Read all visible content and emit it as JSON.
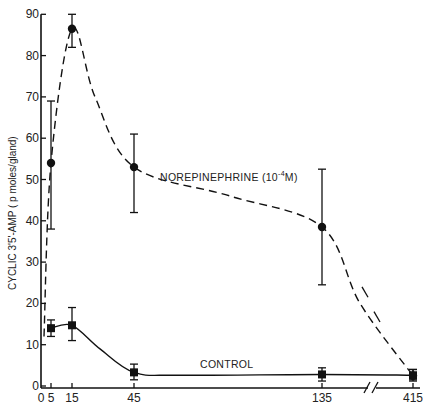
{
  "chart_data": {
    "type": "line",
    "title": "",
    "xlabel": "",
    "ylabel": "CYCLIC 3'5'-AMP ( p moles/gland)",
    "ylim": [
      0,
      90
    ],
    "y_ticks": [
      0,
      10,
      20,
      30,
      40,
      50,
      60,
      70,
      80,
      90
    ],
    "x_ticks": [
      0,
      5,
      15,
      45,
      135,
      415
    ],
    "x_tick_labels": [
      "0",
      "5",
      "15",
      "45",
      "135",
      "415"
    ],
    "x_axis_break": "between 135 and 415",
    "grid": false,
    "x": [
      5,
      15,
      45,
      135,
      415
    ],
    "series": [
      {
        "name": "NOREPINEPHRINE (10^-4 M)",
        "label_text": "NOREPINEPHRINE (10",
        "label_sup": "-4",
        "label_tail": "M)",
        "marker": "circle",
        "line_style": "dashed",
        "values": [
          54,
          86.5,
          53,
          38.5,
          2.5
        ],
        "err_low": [
          38,
          82,
          42,
          24.5,
          1.5
        ],
        "err_high": [
          69,
          90,
          61,
          52.5,
          4
        ]
      },
      {
        "name": "CONTROL",
        "label_text": "CONTROL",
        "marker": "square",
        "line_style": "solid",
        "values": [
          14,
          14.7,
          3.3,
          2.8,
          2.6
        ],
        "err_low": [
          12,
          11,
          1.5,
          1.2,
          1.2
        ],
        "err_high": [
          16,
          19,
          5.3,
          4.4,
          4
        ]
      }
    ]
  }
}
